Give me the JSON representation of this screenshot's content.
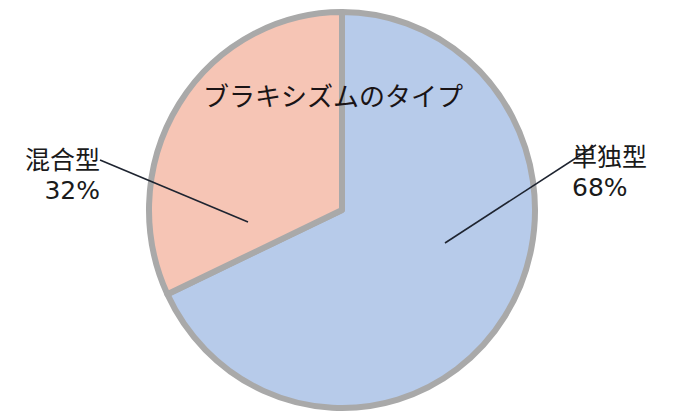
{
  "chart_data": {
    "type": "pie",
    "title": "ブラキシズムのタイプ",
    "categories": [
      "単独型",
      "混合型"
    ],
    "values": [
      68,
      32
    ],
    "unit": "%",
    "colors": {
      "単独型": "#b7cbea",
      "混合型": "#f6c5b5",
      "border": "#a9a9a9",
      "leader_line": "#1e2430"
    },
    "legend": "none (callout labels with leader lines)",
    "labels": [
      {
        "name": "単独型",
        "value_text": "68%",
        "position": "right"
      },
      {
        "name": "混合型",
        "value_text": "32%",
        "position": "left"
      }
    ]
  },
  "title": "ブラキシズムのタイプ",
  "labels": {
    "single": {
      "name": "単独型",
      "pct": "68%"
    },
    "mixed": {
      "name": "混合型",
      "pct": "32%"
    }
  }
}
